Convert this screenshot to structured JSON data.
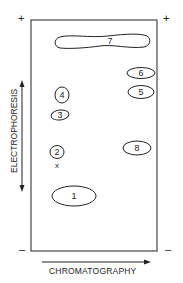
{
  "diagram": {
    "type": "2D peptide map",
    "signs": {
      "top_left": "+",
      "top_right": "+",
      "bottom_left": "–",
      "bottom_right": "–"
    },
    "axes": {
      "vertical_label": "ELECTROPHORESIS",
      "horizontal_label": "CHROMATOGRAPHY"
    },
    "origin_marker": "x",
    "spots": [
      {
        "id": "1",
        "label": "1"
      },
      {
        "id": "2",
        "label": "2"
      },
      {
        "id": "3",
        "label": "3"
      },
      {
        "id": "4",
        "label": "4"
      },
      {
        "id": "5",
        "label": "5"
      },
      {
        "id": "6",
        "label": "6"
      },
      {
        "id": "7",
        "label": "7"
      },
      {
        "id": "8",
        "label": "8"
      }
    ],
    "colors": {
      "ink": "#222222",
      "background": "#ffffff"
    }
  }
}
